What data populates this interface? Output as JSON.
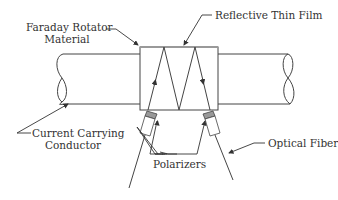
{
  "diagram": {
    "labels": {
      "faraday_line1": "Faraday Rotator",
      "faraday_line2": "Material",
      "reflective_film": "Reflective Thin Film",
      "conductor_line1": "Current Carrying",
      "conductor_line2": "Conductor",
      "polarizers": "Polarizers",
      "optical_fiber": "Optical Fiber"
    },
    "colors": {
      "stroke": "#444444",
      "polarizer_fill": "#999999",
      "text": "#333333",
      "background": "#ffffff"
    }
  }
}
